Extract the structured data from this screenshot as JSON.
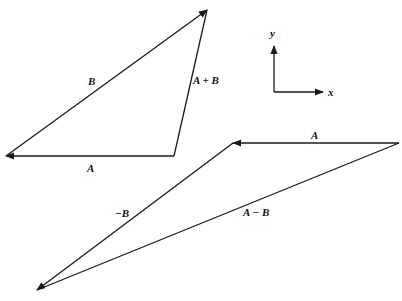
{
  "diagram": {
    "type": "vector-addition-subtraction",
    "triangle_sum": {
      "vectors": [
        {
          "label": "A",
          "from": [
            174,
            156
          ],
          "to": [
            5,
            156
          ]
        },
        {
          "label": "B",
          "from": [
            5,
            156
          ],
          "to": [
            208,
            9
          ]
        },
        {
          "label": "A + B",
          "from": [
            174,
            156
          ],
          "to": [
            208,
            9
          ]
        }
      ]
    },
    "triangle_difference": {
      "vectors": [
        {
          "label": "A",
          "from": [
            399,
            143
          ],
          "to": [
            232,
            143
          ]
        },
        {
          "label": "−B",
          "from": [
            232,
            143
          ],
          "to": [
            36,
            291
          ]
        },
        {
          "label": "A − B",
          "from": [
            399,
            143
          ],
          "to": [
            36,
            291
          ]
        }
      ]
    },
    "axes": {
      "x_label": "x",
      "y_label": "y"
    }
  },
  "labels": {
    "sum_A": "A",
    "sum_B": "B",
    "sum_AplusB": "A + B",
    "diff_A": "A",
    "diff_negB": "−B",
    "diff_AminusB": "A − B",
    "axis_x": "x",
    "axis_y": "y"
  }
}
